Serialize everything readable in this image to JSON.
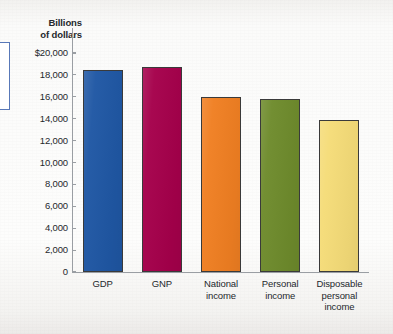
{
  "chart_data": {
    "type": "bar",
    "title": "",
    "subtitle": "",
    "xlabel": "",
    "ylabel": "Billions of dollars",
    "ylim": [
      0,
      20000
    ],
    "grid": false,
    "legend": "none",
    "categories": [
      "GDP",
      "GNP",
      "National income",
      "Personal income",
      "Disposable personal income"
    ],
    "values": [
      18450,
      18700,
      16000,
      15800,
      13900
    ],
    "bar_colors": [
      "#1F57A4",
      "#A5004B",
      "#F07F22",
      "#6E8B2C",
      "#F5DC78"
    ],
    "y_ticks": [
      0,
      2000,
      4000,
      6000,
      8000,
      10000,
      12000,
      14000,
      16000,
      18000,
      20000
    ],
    "y_tick_labels": [
      "0",
      "2,000",
      "4,000",
      "6,000",
      "8,000",
      "10,000",
      "12,000",
      "14,000",
      "16,000",
      "18,000",
      "$20,000"
    ]
  },
  "axis": {
    "title_line1": "Billions",
    "title_line2": "of dollars"
  },
  "categories": [
    {
      "line1": "GDP",
      "line2": "",
      "line3": ""
    },
    {
      "line1": "GNP",
      "line2": "",
      "line3": ""
    },
    {
      "line1": "National",
      "line2": "income",
      "line3": ""
    },
    {
      "line1": "Personal",
      "line2": "income",
      "line3": ""
    },
    {
      "line1": "Disposable",
      "line2": "personal",
      "line3": "income"
    }
  ]
}
